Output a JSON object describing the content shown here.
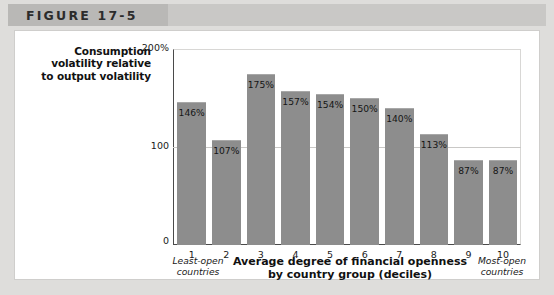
{
  "figure": {
    "label": "FIGURE 17-5"
  },
  "axes": {
    "y_title_line1": "Consumption",
    "y_title_line2": "volatility relative",
    "y_title_line3": "to output volatility",
    "x_title_line1": "Average degree of financial openness",
    "x_title_line2": "by country group (deciles)",
    "note_left_line1": "Least-open",
    "note_left_line2": "countries",
    "note_right_line1": "Most-open",
    "note_right_line2": "countries"
  },
  "colors": {
    "bar_fill": "#8d8d8d",
    "axis_line": "#4a4a4a",
    "gridline": "#c9c8c6",
    "header_band": "#c9c8c6",
    "page_background": "#dedddb",
    "card_background": "#ffffff"
  },
  "chart_data": {
    "type": "bar",
    "title": "FIGURE 17-5",
    "xlabel": "Average degree of financial openness by country group (deciles)",
    "ylabel": "Consumption volatility relative to output volatility",
    "categories": [
      "1",
      "2",
      "3",
      "4",
      "5",
      "6",
      "7",
      "8",
      "9",
      "10"
    ],
    "values": [
      146,
      107,
      175,
      157,
      154,
      150,
      140,
      113,
      87,
      87
    ],
    "data_labels": [
      "146%",
      "107%",
      "175%",
      "157%",
      "154%",
      "150%",
      "140%",
      "113%",
      "87%",
      "87%"
    ],
    "ylim": [
      0,
      200
    ],
    "yticks": [
      0,
      100,
      200
    ],
    "ytick_labels": [
      "0",
      "100",
      "200%"
    ],
    "grid": true,
    "gridlines_at": [
      100
    ],
    "legend": null,
    "annotations": [
      "Least-open countries",
      "Most-open countries"
    ]
  }
}
